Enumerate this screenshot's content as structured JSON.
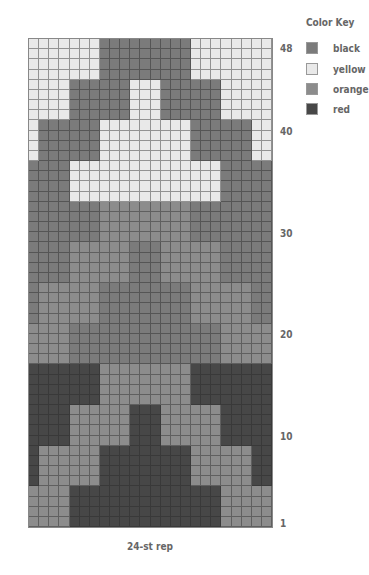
{
  "chart_data": {
    "type": "heatmap",
    "caption": "24-st rep",
    "columns": 24,
    "rows": 48,
    "row_labels": [
      "48",
      "40",
      "30",
      "20",
      "10",
      "1"
    ],
    "legend": [
      {
        "code": "B",
        "name": "black",
        "color": "#7b7b7b"
      },
      {
        "code": "Y",
        "name": "yellow",
        "color": "#e9e9e9"
      },
      {
        "code": "O",
        "name": "orange",
        "color": "#8c8c8c"
      },
      {
        "code": "R",
        "name": "red",
        "color": "#474747"
      }
    ],
    "grid_top_to_bottom": [
      "YYYYYYYBBBBBBBBBYYYYYYYY",
      "YYYYYYYBBBBBBBBBYYYYYYYY",
      "YYYYYYYBBBBBBBBBYYYYYYYY",
      "YYYYYYYBBBBBBBBBYYYYYYYY",
      "YYYYBBBBBBYYYBBBBBBYYYYY",
      "YYYYBBBBBBYYYBBBBBBYYYYY",
      "YYYYBBBBBBYYYBBBBBBYYYYY",
      "YYYYBBBBBBYYYBBBBBBYYYYY",
      "YBBBBBBYYYYYYYYYBBBBBBYY",
      "YBBBBBBYYYYYYYYYBBBBBBYY",
      "YBBBBBBYYYYYYYYYBBBBBBYY",
      "YBBBBBBYYYYYYYYYBBBBBBYY",
      "BBBBYYYYYYYYYYYYYYYBBBBB",
      "BBBBYYYYYYYYYYYYYYYBBBBB",
      "BBBBYYYYYYYYYYYYYYYBBBBB",
      "BBBBYYYYYYYYYYYYYYYBBBBB",
      "BBBBBBBOOOOOOOOOBBBBBBBB",
      "BBBBBBBOOOOOOOOOBBBBBBBB",
      "BBBBBBBOOOOOOOOOBBBBBBBB",
      "BBBBBBBOOOOOOOOOBBBBBBBB",
      "BBBBOOOOOOBBBOOOOOOBBBBB",
      "BBBBOOOOOOBBBOOOOOOBBBBB",
      "BBBBOOOOOOBBBOOOOOOBBBBB",
      "BBBBOOOOOOBBBOOOOOOBBBBB",
      "BOOOOOOBBBBBBBBBOOOOOOBB",
      "BOOOOOOBBBBBBBBBOOOOOOBB",
      "BOOOOOOBBBBBBBBBOOOOOOBB",
      "BOOOOOOBBBBBBBBBOOOOOOBB",
      "OOOOBBBBBBBBBBBBBBBOOOOO",
      "OOOOBBBBBBBBBBBBBBBOOOOO",
      "OOOOBBBBBBBBBBBBBBBOOOOO",
      "OOOOBBBBBBBBBBBBBBBOOOOO",
      "RRRRRRROOOOOOOOORRRRRRRR",
      "RRRRRRROOOOOOOOORRRRRRRR",
      "RRRRRRROOOOOOOOORRRRRRRR",
      "RRRRRRROOOOOOOOORRRRRRRR",
      "RRRROOOOOORRROOOOOORRRRR",
      "RRRROOOOOORRROOOOOORRRRR",
      "RRRROOOOOORRROOOOOORRRRR",
      "RRRROOOOOORRROOOOOORRRRR",
      "ROOOOOORRRRRRRRROOOOOORR",
      "ROOOOOORRRRRRRRROOOOOORR",
      "ROOOOOORRRRRRRRROOOOOORR",
      "ROOOOOORRRRRRRRROOOOOORR",
      "OOOORRRRRRRRRRRRRRROOOOO",
      "OOOORRRRRRRRRRRRRRROOOOO",
      "OOOORRRRRRRRRRRRRRROOOOO",
      "OOOORRRRRRRRRRRRRRROOOOO"
    ]
  },
  "key": {
    "title": "Color Key",
    "items": [
      {
        "label": "black"
      },
      {
        "label": "yellow"
      },
      {
        "label": "orange"
      },
      {
        "label": "red"
      }
    ]
  },
  "row_numbers": {
    "r48": "48",
    "r40": "40",
    "r30": "30",
    "r20": "20",
    "r10": "10",
    "r1": "1"
  },
  "caption": "24-st rep"
}
